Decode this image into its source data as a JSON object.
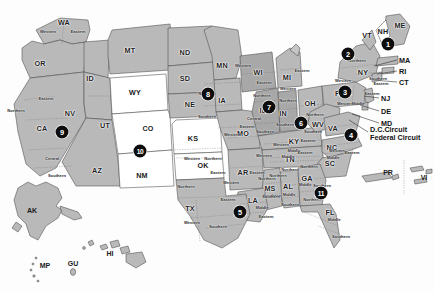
{
  "map": {
    "title": "United States Federal Judicial Circuits",
    "background_color": "#fdfdfd",
    "fill_gray": "#b9b9b9",
    "fill_gray_dark": "#a6a6a6",
    "fill_white": "#ffffff",
    "stroke_color": "#4a4a4a",
    "badge_color": "#0d0d0d",
    "badge_text_color": "#ffffff"
  },
  "states": [
    {
      "abbr": "WA",
      "x": 64,
      "y": 22
    },
    {
      "abbr": "OR",
      "x": 40,
      "y": 63
    },
    {
      "abbr": "ID",
      "x": 90,
      "y": 78
    },
    {
      "abbr": "MT",
      "x": 130,
      "y": 50
    },
    {
      "abbr": "ND",
      "x": 185,
      "y": 52
    },
    {
      "abbr": "SD",
      "x": 185,
      "y": 78
    },
    {
      "abbr": "NE",
      "x": 190,
      "y": 104
    },
    {
      "abbr": "KS",
      "x": 193,
      "y": 138
    },
    {
      "abbr": "WY",
      "x": 135,
      "y": 92
    },
    {
      "abbr": "UT",
      "x": 105,
      "y": 125
    },
    {
      "abbr": "CO",
      "x": 148,
      "y": 128
    },
    {
      "abbr": "NV",
      "x": 70,
      "y": 113
    },
    {
      "abbr": "CA",
      "x": 42,
      "y": 128
    },
    {
      "abbr": "AZ",
      "x": 97,
      "y": 170
    },
    {
      "abbr": "NM",
      "x": 142,
      "y": 175
    },
    {
      "abbr": "TX",
      "x": 190,
      "y": 208
    },
    {
      "abbr": "OK",
      "x": 203,
      "y": 165
    },
    {
      "abbr": "MN",
      "x": 222,
      "y": 65
    },
    {
      "abbr": "IA",
      "x": 222,
      "y": 100
    },
    {
      "abbr": "MO",
      "x": 243,
      "y": 133
    },
    {
      "abbr": "AR",
      "x": 243,
      "y": 172
    },
    {
      "abbr": "LA",
      "x": 253,
      "y": 200
    },
    {
      "abbr": "MS",
      "x": 270,
      "y": 188
    },
    {
      "abbr": "AL",
      "x": 288,
      "y": 186
    },
    {
      "abbr": "WI",
      "x": 258,
      "y": 72
    },
    {
      "abbr": "IL",
      "x": 263,
      "y": 110
    },
    {
      "abbr": "IN",
      "x": 283,
      "y": 113
    },
    {
      "abbr": "MI",
      "x": 287,
      "y": 77
    },
    {
      "abbr": "OH",
      "x": 310,
      "y": 103
    },
    {
      "abbr": "KY",
      "x": 294,
      "y": 141
    },
    {
      "abbr": "TN",
      "x": 290,
      "y": 159
    },
    {
      "abbr": "GA",
      "x": 307,
      "y": 178
    },
    {
      "abbr": "FL",
      "x": 330,
      "y": 212
    },
    {
      "abbr": "SC",
      "x": 330,
      "y": 163
    },
    {
      "abbr": "NC",
      "x": 332,
      "y": 147
    },
    {
      "abbr": "VA",
      "x": 333,
      "y": 128
    },
    {
      "abbr": "WV",
      "x": 318,
      "y": 124
    },
    {
      "abbr": "PA",
      "x": 340,
      "y": 93
    },
    {
      "abbr": "NY",
      "x": 363,
      "y": 72
    },
    {
      "abbr": "VT",
      "x": 367,
      "y": 35
    },
    {
      "abbr": "NH",
      "x": 383,
      "y": 31
    },
    {
      "abbr": "ME",
      "x": 400,
      "y": 25
    }
  ],
  "districts": [
    {
      "name": "Western",
      "x": 48,
      "y": 31
    },
    {
      "name": "Eastern",
      "x": 78,
      "y": 31
    },
    {
      "name": "Northern",
      "x": 16,
      "y": 110
    },
    {
      "name": "Eastern",
      "x": 46,
      "y": 98
    },
    {
      "name": "Central",
      "x": 52,
      "y": 158
    },
    {
      "name": "Southern",
      "x": 57,
      "y": 175
    },
    {
      "name": "Northern",
      "x": 207,
      "y": 93
    },
    {
      "name": "Southern",
      "x": 207,
      "y": 116
    },
    {
      "name": "Western",
      "x": 243,
      "y": 65
    },
    {
      "name": "Eastern",
      "x": 264,
      "y": 82
    },
    {
      "name": "Northern",
      "x": 262,
      "y": 95
    },
    {
      "name": "Central",
      "x": 254,
      "y": 118
    },
    {
      "name": "Southern",
      "x": 265,
      "y": 131
    },
    {
      "name": "Northern",
      "x": 288,
      "y": 100
    },
    {
      "name": "Southern",
      "x": 285,
      "y": 124
    },
    {
      "name": "Eastern",
      "x": 302,
      "y": 70
    },
    {
      "name": "Western",
      "x": 288,
      "y": 88
    },
    {
      "name": "Northern",
      "x": 315,
      "y": 114
    },
    {
      "name": "Southern",
      "x": 313,
      "y": 131
    },
    {
      "name": "Eastern",
      "x": 308,
      "y": 140
    },
    {
      "name": "Western",
      "x": 281,
      "y": 144
    },
    {
      "name": "Middle",
      "x": 294,
      "y": 150
    },
    {
      "name": "Eastern",
      "x": 305,
      "y": 152
    },
    {
      "name": "Western",
      "x": 264,
      "y": 155
    },
    {
      "name": "Middle",
      "x": 288,
      "y": 156
    },
    {
      "name": "Eastern",
      "x": 247,
      "y": 126
    },
    {
      "name": "Western",
      "x": 232,
      "y": 134
    },
    {
      "name": "Eastern",
      "x": 257,
      "y": 172
    },
    {
      "name": "Western",
      "x": 231,
      "y": 182
    },
    {
      "name": "Northern",
      "x": 278,
      "y": 175
    },
    {
      "name": "Southern",
      "x": 272,
      "y": 195
    },
    {
      "name": "Northern",
      "x": 267,
      "y": 178
    },
    {
      "name": "Southern",
      "x": 271,
      "y": 196
    },
    {
      "name": "Middle",
      "x": 262,
      "y": 207
    },
    {
      "name": "Eastern",
      "x": 266,
      "y": 216
    },
    {
      "name": "Northern",
      "x": 290,
      "y": 169
    },
    {
      "name": "Middle",
      "x": 289,
      "y": 194
    },
    {
      "name": "Southern",
      "x": 290,
      "y": 204
    },
    {
      "name": "Northern",
      "x": 309,
      "y": 166
    },
    {
      "name": "Middle",
      "x": 305,
      "y": 184
    },
    {
      "name": "Southern",
      "x": 322,
      "y": 185
    },
    {
      "name": "Northern",
      "x": 312,
      "y": 199
    },
    {
      "name": "Middle",
      "x": 334,
      "y": 219
    },
    {
      "name": "Southern",
      "x": 341,
      "y": 236
    },
    {
      "name": "Western",
      "x": 192,
      "y": 158
    },
    {
      "name": "Northern",
      "x": 213,
      "y": 158
    },
    {
      "name": "Eastern",
      "x": 218,
      "y": 172
    },
    {
      "name": "Northern",
      "x": 186,
      "y": 186
    },
    {
      "name": "Eastern",
      "x": 228,
      "y": 199
    },
    {
      "name": "Western",
      "x": 192,
      "y": 222
    },
    {
      "name": "Southern",
      "x": 218,
      "y": 226
    },
    {
      "name": "Western",
      "x": 345,
      "y": 103
    },
    {
      "name": "Middle",
      "x": 358,
      "y": 103
    },
    {
      "name": "Eastern",
      "x": 372,
      "y": 93
    },
    {
      "name": "Northern",
      "x": 357,
      "y": 60
    },
    {
      "name": "Western",
      "x": 343,
      "y": 80
    },
    {
      "name": "Southern",
      "x": 378,
      "y": 78
    },
    {
      "name": "Eastern",
      "x": 381,
      "y": 83
    },
    {
      "name": "Western",
      "x": 337,
      "y": 150
    },
    {
      "name": "Eastern",
      "x": 352,
      "y": 152
    },
    {
      "name": "Middle",
      "x": 333,
      "y": 157
    }
  ],
  "circuit_badges": [
    {
      "number": "1",
      "x": 388,
      "y": 44
    },
    {
      "number": "2",
      "x": 348,
      "y": 54
    },
    {
      "number": "3",
      "x": 345,
      "y": 92
    },
    {
      "number": "4",
      "x": 351,
      "y": 135
    },
    {
      "number": "5",
      "x": 240,
      "y": 212
    },
    {
      "number": "6",
      "x": 301,
      "y": 123
    },
    {
      "number": "7",
      "x": 269,
      "y": 107
    },
    {
      "number": "8",
      "x": 208,
      "y": 94
    },
    {
      "number": "9",
      "x": 62,
      "y": 132
    },
    {
      "number": "10",
      "x": 140,
      "y": 151
    },
    {
      "number": "11",
      "x": 321,
      "y": 193
    }
  ],
  "callouts": [
    {
      "label": "MA",
      "x": 399,
      "y": 60,
      "leader": {
        "x1": 397,
        "y1": 60,
        "x2": 374,
        "y2": 66
      }
    },
    {
      "label": "RI",
      "x": 399,
      "y": 71,
      "leader": {
        "x1": 397,
        "y1": 71,
        "x2": 377,
        "y2": 74
      }
    },
    {
      "label": "CT",
      "x": 399,
      "y": 82,
      "leader": {
        "x1": 397,
        "y1": 82,
        "x2": 373,
        "y2": 80
      }
    },
    {
      "label": "NJ",
      "x": 381,
      "y": 98,
      "leader": {
        "x1": 379,
        "y1": 98,
        "x2": 364,
        "y2": 96
      }
    },
    {
      "label": "DE",
      "x": 381,
      "y": 111,
      "leader": {
        "x1": 379,
        "y1": 111,
        "x2": 360,
        "y2": 105
      }
    },
    {
      "label": "MD",
      "x": 381,
      "y": 123,
      "leader": {
        "x1": 379,
        "y1": 123,
        "x2": 352,
        "y2": 114
      }
    }
  ],
  "special_courts": {
    "line1": "D.C.Circuit",
    "line2": "Federal Circuit",
    "x": 370,
    "y": 134,
    "leader": {
      "x1": 368,
      "y1": 132,
      "x2": 349,
      "y2": 120
    }
  },
  "territories": [
    {
      "abbr": "AK",
      "x": 32,
      "y": 210
    },
    {
      "abbr": "HI",
      "x": 110,
      "y": 253
    },
    {
      "abbr": "MP",
      "x": 45,
      "y": 265
    },
    {
      "abbr": "GU",
      "x": 73,
      "y": 263
    },
    {
      "abbr": "PR",
      "x": 388,
      "y": 172
    },
    {
      "abbr": "VI",
      "x": 424,
      "y": 177
    }
  ]
}
